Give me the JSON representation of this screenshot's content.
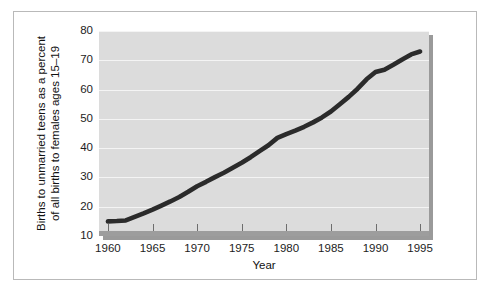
{
  "chart_data": {
    "type": "line",
    "title": "",
    "xlabel": "Year",
    "ylabel_line1": "Births to unmarried teens as a percent",
    "ylabel_line2": "of all births to females ages 15–19",
    "xlim": [
      1959,
      1996
    ],
    "ylim": [
      10,
      80
    ],
    "xticks": [
      1960,
      1965,
      1970,
      1975,
      1980,
      1985,
      1990,
      1995
    ],
    "xtick_labels": [
      "1960",
      "1965",
      "1970",
      "1975",
      "1980",
      "1985",
      "1990",
      "1995"
    ],
    "yticks": [
      10,
      20,
      30,
      40,
      50,
      60,
      70,
      80
    ],
    "ytick_labels": [
      "10",
      "20",
      "30",
      "40",
      "50",
      "60",
      "70",
      "80"
    ],
    "grid": "horizontal",
    "legend": "none",
    "series": [
      {
        "name": "Births to unmarried teens as a percent of all births to females ages 15-19",
        "color": "#2b2b2b",
        "x": [
          1960,
          1961,
          1962,
          1963,
          1964,
          1965,
          1966,
          1967,
          1968,
          1969,
          1970,
          1971,
          1972,
          1973,
          1974,
          1975,
          1976,
          1977,
          1978,
          1979,
          1980,
          1981,
          1982,
          1983,
          1984,
          1985,
          1986,
          1987,
          1988,
          1989,
          1990,
          1991,
          1992,
          1993,
          1994,
          1995
        ],
        "values": [
          15.0,
          15.1,
          15.3,
          16.5,
          17.7,
          19.0,
          20.4,
          21.8,
          23.3,
          25.1,
          27.0,
          28.5,
          30.1,
          31.6,
          33.3,
          35.0,
          36.9,
          39.0,
          41.0,
          43.5,
          44.8,
          46.0,
          47.3,
          48.8,
          50.5,
          52.5,
          55.0,
          57.5,
          60.3,
          63.5,
          66.0,
          66.8,
          68.5,
          70.3,
          72.0,
          73.0
        ]
      }
    ]
  }
}
